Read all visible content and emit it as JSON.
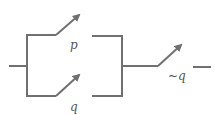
{
  "diagram": {
    "type": "switching-circuit",
    "wire_color": "#707070",
    "label_color": "#555555",
    "switches": [
      {
        "label": "p",
        "branch": "top-parallel"
      },
      {
        "label": "q",
        "branch": "bottom-parallel"
      },
      {
        "label": "~q",
        "branch": "series"
      }
    ]
  }
}
